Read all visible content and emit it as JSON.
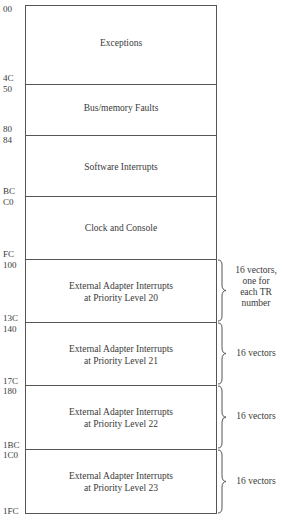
{
  "diagram": {
    "type": "memory-map",
    "regions": [
      {
        "name": "exceptions",
        "label": "Exceptions",
        "start": "00",
        "end": "4C"
      },
      {
        "name": "bus-memory-faults",
        "label": "Bus/memory Faults",
        "start": "50",
        "end": "80"
      },
      {
        "name": "software-interrupts",
        "label": "Software Interrupts",
        "start": "84",
        "end": "BC"
      },
      {
        "name": "clock-console",
        "label": "Clock and Console",
        "start": "C0",
        "end": "FC"
      },
      {
        "name": "ext-adapter-20",
        "label_line1": "External Adapter Interrupts",
        "label_line2": "at Priority Level 20",
        "start": "100",
        "end": "13C",
        "note_lines": [
          "16 vectors,",
          "one for",
          "each TR",
          "number"
        ]
      },
      {
        "name": "ext-adapter-21",
        "label_line1": "External Adapter Interrupts",
        "label_line2": "at Priority Level 21",
        "start": "140",
        "end": "17C",
        "note": "16 vectors"
      },
      {
        "name": "ext-adapter-22",
        "label_line1": "External Adapter Interrupts",
        "label_line2": "at Priority Level 22",
        "start": "180",
        "end": "1BC",
        "note": "16 vectors"
      },
      {
        "name": "ext-adapter-23",
        "label_line1": "External Adapter Interrupts",
        "label_line2": "at Priority Level 23",
        "start": "1C0",
        "end": "1FC",
        "note": "16 vectors"
      }
    ]
  }
}
